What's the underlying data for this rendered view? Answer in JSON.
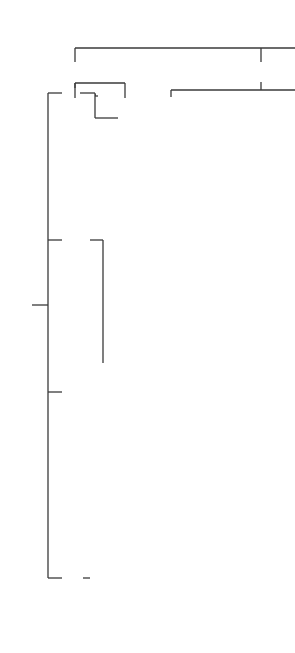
{
  "diagram": {
    "categories": {
      "communication": {
        "label": "Communication",
        "children": [
          "Satellite",
          "Terrestrial links"
        ],
        "children_lines": [
          [
            "Satellite"
          ],
          [
            "Terrestrial",
            "links"
          ]
        ]
      },
      "radar": {
        "label": "Radar",
        "civilian": {
          "label": "Civilian",
          "children": [
            "Air traffic control",
            "Aircraft navigation",
            "Ship safety",
            "Sapace vehicles",
            "Remote sensing",
            "Law enforcement",
            "Disaster management"
          ],
          "lines": {
            "atc": "Air traffic control",
            "aircraft_1": "Aircraft",
            "aircraft_2": "navigation",
            "ship": "Ship safety",
            "space": "Sapace vehicles",
            "remote": "Remote sensing",
            "law": "Law enforcement",
            "disaster": "Disaster management"
          }
        },
        "military": {
          "label": "Military",
          "children": [
            "Surveillance",
            "Navigation",
            "Weapon guidance",
            "Electronic warfare",
            "C3"
          ],
          "lines": {
            "surveillance": "Surveillance",
            "navigation": "Navigation",
            "weapon_1": "Weapon",
            "weapon_2": "guidance",
            "ew_1": "Electronic",
            "ew_2": "warfare",
            "c3_base": "C",
            "c3_sup": "3"
          }
        }
      },
      "industrial": {
        "label_1": "Industrial and",
        "label_2": "biomedical",
        "children": [
          "Process control",
          "Drying",
          "Curing",
          "Treatment of elastomers",
          "Waste treatment",
          "Monitoring",
          "Imaging",
          "Hyperthermia"
        ],
        "lines": {
          "process": "Process control",
          "drying": "Drying",
          "curing": "Curing",
          "treat_1": "Treatment of",
          "treat_2": "elastomers",
          "waste": "Waste treatment",
          "monitoring": "Monitoring",
          "imaging": "Imaging",
          "hyperthermia": "Hyperthermia"
        },
        "waste_children": [
          "Nuclear",
          "Cellulosic"
        ]
      },
      "heating": {
        "label": "Heating",
        "children": [
          "Industrial",
          "Household"
        ]
      }
    }
  }
}
